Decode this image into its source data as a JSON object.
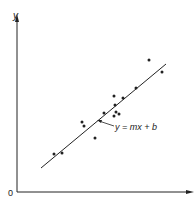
{
  "chart_data": {
    "type": "scatter",
    "title": "",
    "xlabel": "",
    "ylabel": "y",
    "origin_label": "0",
    "grid": false,
    "legend": null,
    "xlim": [
      0,
      176
    ],
    "ylim": [
      0,
      177
    ],
    "points": [
      {
        "x": 37,
        "y": 38
      },
      {
        "x": 45,
        "y": 39
      },
      {
        "x": 65,
        "y": 70
      },
      {
        "x": 67,
        "y": 66
      },
      {
        "x": 78,
        "y": 54
      },
      {
        "x": 87,
        "y": 79
      },
      {
        "x": 97,
        "y": 96
      },
      {
        "x": 98,
        "y": 87
      },
      {
        "x": 97,
        "y": 76
      },
      {
        "x": 99,
        "y": 80
      },
      {
        "x": 102,
        "y": 78
      },
      {
        "x": 106,
        "y": 94
      },
      {
        "x": 119,
        "y": 104
      },
      {
        "x": 132,
        "y": 132
      },
      {
        "x": 145,
        "y": 120
      }
    ],
    "fit_line": {
      "x1": 24,
      "y1": 24,
      "x2": 149,
      "y2": 128
    },
    "annotations": [
      {
        "text": "y = mx + b",
        "target": "fit_line"
      }
    ]
  },
  "labels": {
    "y_axis": "y",
    "origin": "0",
    "equation": "y = mx + b"
  },
  "colors": {
    "ink": "#222222",
    "background": "#ffffff"
  }
}
